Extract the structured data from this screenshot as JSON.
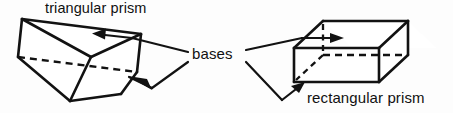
{
  "figure": {
    "background_color": "#fdfdfd",
    "ink_color": "#121212",
    "width": 453,
    "height": 113
  },
  "labels": {
    "triangular_prism": "triangular prism",
    "bases": "bases",
    "rectangular_prism": "rectangular prism"
  },
  "shapes": [
    {
      "name": "triangular-prism",
      "kind": "triangular prism",
      "label": "triangular prism",
      "visible_faces": [
        "top-rear-rectangular-face",
        "front-left-rectangular-face",
        "front-right-rectangular-face"
      ],
      "base_faces": [
        "upper-triangular-base",
        "lower-triangular-base"
      ],
      "hidden_edges": 1
    },
    {
      "name": "rectangular-prism",
      "kind": "rectangular prism",
      "label": "rectangular prism",
      "visible_faces": [
        "top-face",
        "front-face",
        "right-end-face"
      ],
      "base_faces": [
        "top-rectangular-base",
        "bottom-rectangular-base"
      ],
      "hidden_edges": 3
    }
  ],
  "callouts": [
    {
      "name": "callout-triangular-upper-base",
      "from": "bases",
      "to": "triangular-prism upper base",
      "arrow_direction": "left"
    },
    {
      "name": "callout-triangular-lower-base",
      "from": "bases",
      "to": "triangular-prism lower base",
      "arrow_direction": "up-left"
    },
    {
      "name": "callout-rectangular-upper-base",
      "from": "bases",
      "to": "rectangular-prism top base",
      "arrow_direction": "right"
    },
    {
      "name": "callout-rectangular-lower-base",
      "from": "bases",
      "to": "rectangular-prism bottom base",
      "arrow_direction": "up-right"
    }
  ]
}
